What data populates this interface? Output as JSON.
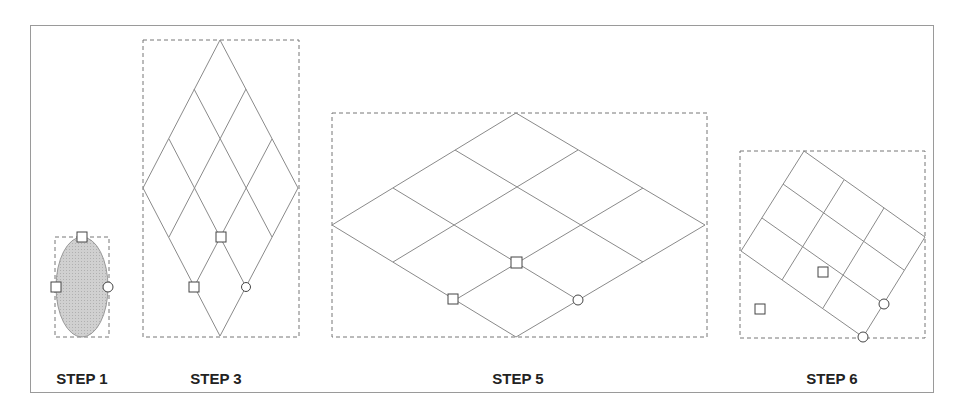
{
  "steps": [
    {
      "label": "STEP 1",
      "x": 82
    },
    {
      "label": "STEP 3",
      "x": 216
    },
    {
      "label": "STEP 5",
      "x": 518
    },
    {
      "label": "STEP 6",
      "x": 832
    }
  ],
  "colors": {
    "line": "#8a8a8a",
    "dash": "#777777",
    "fill": "#cccccc",
    "frame": "#9a9a9a"
  }
}
